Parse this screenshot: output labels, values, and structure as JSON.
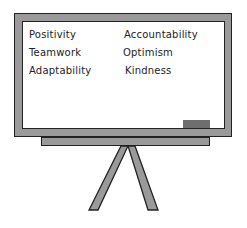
{
  "whiteboard": {
    "words_left": [
      "Positivity",
      "Teamwork",
      "Adaptability"
    ],
    "words_right": [
      "Accountability",
      "Optimism",
      "Kindness"
    ]
  },
  "colors": {
    "frame": "#9a9a9a",
    "board": "#ffffff",
    "eraser": "#6e6e6e",
    "outline": "#222222"
  }
}
